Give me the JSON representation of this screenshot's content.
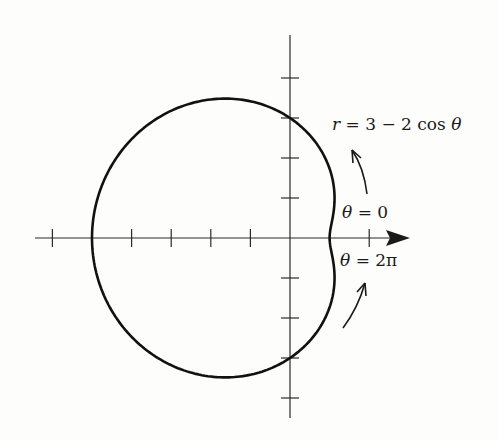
{
  "chart_data": {
    "type": "line",
    "subtype": "polar",
    "title": "",
    "equation": "r = 3 - 2 cos θ",
    "curve": {
      "name": "limaçon",
      "function": "r = 3 - 2cos(theta)",
      "theta_range": [
        0,
        6.283185
      ],
      "points": [
        {
          "theta": "0",
          "r": 1
        },
        {
          "theta": "π/2",
          "r": 3
        },
        {
          "theta": "π",
          "r": 5
        },
        {
          "theta": "3π/2",
          "r": 3
        },
        {
          "theta": "2π",
          "r": 1
        }
      ]
    },
    "axes": {
      "x_ticks": [
        -6,
        -5,
        -4,
        -3,
        -2,
        -1,
        1,
        2
      ],
      "y_ticks": [
        -4,
        -3,
        -2,
        -1,
        1,
        2,
        3,
        4
      ],
      "x_range": [
        -6.4,
        3.0
      ],
      "y_range": [
        -4.5,
        5.1
      ],
      "grid": false,
      "polar_axis_arrow": true
    },
    "annotations": [
      {
        "text": "r = 3 − 2 cos θ",
        "position": "upper right"
      },
      {
        "text": "θ = 0",
        "position": "right, above axis"
      },
      {
        "text": "θ = 2π",
        "position": "right, below axis"
      }
    ]
  },
  "labels": {
    "equation_r": "r",
    "equation_rest": " = 3 − 2 cos ",
    "equation_theta": "θ",
    "theta0_var": "θ",
    "theta0_rest": " = 0",
    "theta2pi_var": "θ",
    "theta2pi_rest": " = 2π"
  },
  "style": {
    "ink": "#1a1a1a",
    "background": "#fdfdfb"
  }
}
